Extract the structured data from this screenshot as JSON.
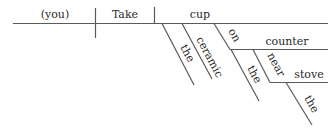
{
  "diagram": {
    "type": "reed-kellogg sentence diagram",
    "sentence_words": {
      "subject": "(you)",
      "verb": "Take",
      "direct_object": "cup",
      "object_modifiers": [
        "the",
        "ceramic"
      ],
      "preposition_1": "on",
      "object_of_preposition_1": "counter",
      "counter_modifier": "the",
      "preposition_2": "near",
      "object_of_preposition_2": "stove",
      "stove_modifier": "the"
    },
    "colors": {
      "line": "#5a5a5a",
      "text": "#2a2a2a",
      "background": "#ffffff"
    }
  }
}
